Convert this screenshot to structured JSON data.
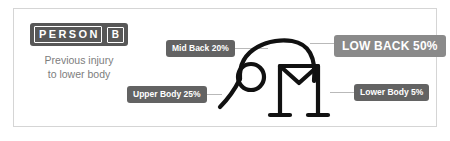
{
  "card": {
    "border_color": "#d5d5d5",
    "background": "#ffffff"
  },
  "person": {
    "badge_word": "PERSON",
    "badge_letter": "B",
    "badge_color": "#575757",
    "subtitle": "Previous injury\nto lower body",
    "subtitle_color": "#7d7d7d"
  },
  "figure": {
    "stroke_color": "#111111"
  },
  "callouts": [
    {
      "id": "mid-back",
      "label": "Mid Back 20%",
      "percent": 20,
      "color": "#636363",
      "emphasis": false
    },
    {
      "id": "upper-body",
      "label": "Upper Body 25%",
      "percent": 25,
      "color": "#636363",
      "emphasis": false
    },
    {
      "id": "low-back",
      "label": "LOW BACK 50%",
      "percent": 50,
      "color": "#8a8a8a",
      "emphasis": true
    },
    {
      "id": "lower-body",
      "label": "Lower Body 5%",
      "percent": 5,
      "color": "#636363",
      "emphasis": false
    }
  ],
  "leader_line_color": "#b9b9b9"
}
